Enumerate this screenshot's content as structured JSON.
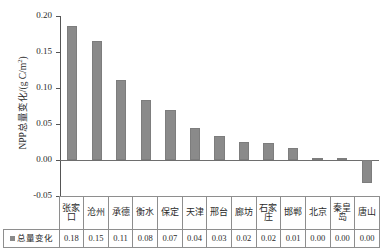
{
  "chart_data": {
    "type": "bar",
    "title": "",
    "subtitle": "",
    "xlabel": "",
    "ylabel": "NPP总量变化/(g C/m²)",
    "ylabel_prefix": "NPP总量变化/(g C/m",
    "ylabel_exponent": "2",
    "ylabel_suffix": ")",
    "categories": [
      "张家口",
      "沧州",
      "承德",
      "衡水",
      "保定",
      "天津",
      "邢台",
      "廊坊",
      "石家庄",
      "邯郸",
      "北京",
      "秦皇岛",
      "唐山"
    ],
    "values": [
      0.186,
      0.165,
      0.111,
      0.083,
      0.07,
      0.044,
      0.033,
      0.025,
      0.024,
      0.017,
      0.003,
      0.003,
      -0.032
    ],
    "labels": [
      "0.18",
      "0.15",
      "0.11",
      "0.08",
      "0.07",
      "0.04",
      "0.03",
      "0.02",
      "0.02",
      "0.01",
      "0.00",
      "0.00",
      "0.00"
    ],
    "series": [
      {
        "name": "总量变化",
        "color": "#8a8a8a",
        "values": [
          0.186,
          0.165,
          0.111,
          0.083,
          0.07,
          0.044,
          0.033,
          0.025,
          0.024,
          0.017,
          0.003,
          0.003,
          -0.032
        ]
      }
    ],
    "ylim": [
      -0.05,
      0.2
    ],
    "yticks": [
      0.2,
      0.15,
      0.1,
      0.05,
      0.0,
      -0.05
    ],
    "ytick_labels": [
      "0.20",
      "0.15",
      "0.10",
      "0.05",
      "0.00",
      "-0.05"
    ],
    "grid": false,
    "legend_position": "table-row-left",
    "bar_color": "#8a8a8a",
    "axis_color": "#555555"
  },
  "table": {
    "legend_label": "总量变化",
    "header_cells": [
      "张家口",
      "沧州",
      "承德",
      "衡水",
      "保定",
      "天津",
      "邢台",
      "廊坊",
      "石家庄",
      "邯郸",
      "北京",
      "秦皇岛",
      "唐山"
    ],
    "value_cells": [
      "0.18",
      "0.15",
      "0.11",
      "0.08",
      "0.07",
      "0.04",
      "0.03",
      "0.02",
      "0.02",
      "0.01",
      "0.00",
      "0.00",
      "0.00"
    ]
  }
}
